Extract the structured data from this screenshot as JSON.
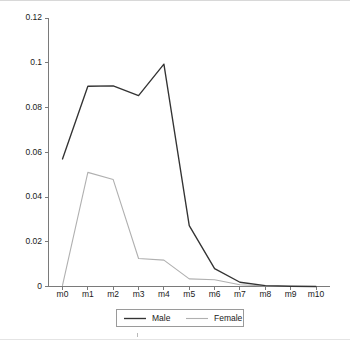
{
  "chart_data": {
    "type": "line",
    "title": "",
    "xlabel": "",
    "ylabel": "",
    "categories": [
      "m0",
      "m1",
      "m2",
      "m3",
      "m4",
      "m5",
      "m6",
      "m7",
      "m8",
      "m9",
      "m10"
    ],
    "series": [
      {
        "name": "Male",
        "color": "#333333",
        "values": [
          0.057,
          0.0895,
          0.0897,
          0.0853,
          0.0994,
          0.0272,
          0.008,
          0.0019,
          0.0004,
          0.0001,
          0
        ]
      },
      {
        "name": "Female",
        "color": "#b0b0b0",
        "values": [
          0.0005,
          0.051,
          0.0478,
          0.0125,
          0.0118,
          0.0034,
          0.003,
          0.0008,
          0.0002,
          0,
          0
        ]
      }
    ],
    "ylim": [
      0,
      0.12
    ],
    "yticks": [
      0,
      0.02,
      0.04,
      0.06,
      0.08,
      0.1,
      0.12
    ],
    "ytick_labels": [
      "0",
      "0.02",
      "0.04",
      "0.06",
      "0.08",
      "0.1",
      "0.12"
    ],
    "grid": false,
    "legend_position": "bottom",
    "legend_entries": [
      "Male",
      "Female"
    ]
  },
  "axes": {
    "y_axis_name": "y-axis",
    "x_axis_name": "x-axis"
  }
}
